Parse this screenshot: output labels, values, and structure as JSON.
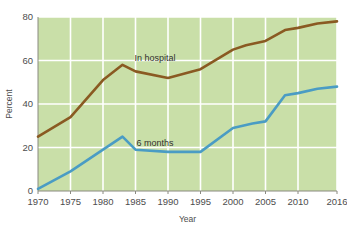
{
  "chart_data": {
    "type": "line",
    "title": "",
    "xlabel": "Year",
    "ylabel": "Percent",
    "xlim": [
      1970,
      2016
    ],
    "ylim": [
      0,
      80
    ],
    "grid": true,
    "legend_position": "inline-annotations",
    "xticks": [
      1970,
      1975,
      1980,
      1985,
      1990,
      1995,
      2000,
      2005,
      2010,
      2016
    ],
    "xtick_labels": [
      "1970",
      "1975",
      "1980",
      "1985",
      "1990",
      "1995",
      "2000",
      "2005",
      "2010",
      "2016"
    ],
    "yticks": [
      0,
      20,
      40,
      60,
      80
    ],
    "ytick_labels": [
      "0",
      "20",
      "40",
      "60",
      "80"
    ],
    "series": [
      {
        "name": "In hospital",
        "color": "#8a5a22",
        "label_x": 1988,
        "label_y": 61,
        "x": [
          1970,
          1975,
          1980,
          1983,
          1985,
          1990,
          1995,
          2000,
          2002,
          2005,
          2008,
          2010,
          2013,
          2016
        ],
        "values": [
          25,
          34,
          51,
          58,
          55,
          52,
          56,
          65,
          67,
          69,
          74,
          75,
          77,
          78
        ]
      },
      {
        "name": "6 months",
        "color": "#4a9cc4",
        "label_x": 1988,
        "label_y": 22,
        "x": [
          1970,
          1975,
          1980,
          1983,
          1985,
          1990,
          1995,
          2000,
          2003,
          2005,
          2008,
          2010,
          2013,
          2016
        ],
        "values": [
          1,
          9,
          19,
          25,
          19,
          18,
          18,
          29,
          31,
          32,
          44,
          45,
          47,
          48
        ]
      }
    ]
  },
  "style": {
    "plot_background": "#c9dfa8",
    "grid_color": "#ffffff",
    "axis_color": "#8a8a80",
    "page_background": "#ffffff"
  }
}
